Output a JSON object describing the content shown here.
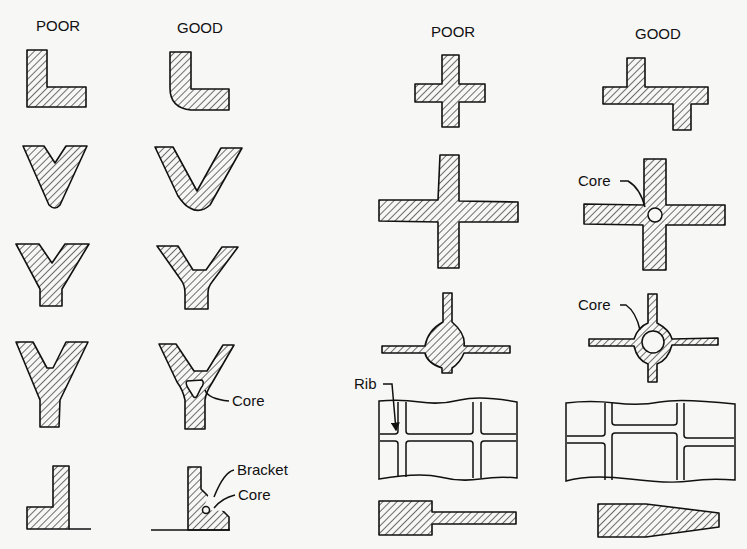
{
  "figure": {
    "left_panel": {
      "headers": {
        "poor": "POOR",
        "good": "GOOD"
      },
      "rows": [
        {
          "name": "L-section",
          "poor": "sharp inside corner",
          "good": "rounded corner"
        },
        {
          "name": "V-section",
          "poor": "sharp V",
          "good": "rounded V"
        },
        {
          "name": "Y-section",
          "poor": "sharp Y",
          "good": "filleted Y"
        },
        {
          "name": "Y-section-heavy",
          "poor": "heavy junction",
          "good": "cored junction",
          "good_label": "Core"
        },
        {
          "name": "T-bracket",
          "poor": "plain L",
          "good": "bracket with core",
          "good_labels": [
            "Bracket",
            "Core"
          ]
        }
      ]
    },
    "right_panel": {
      "headers": {
        "poor": "POOR",
        "good": "GOOD"
      },
      "rows": [
        {
          "name": "cross-small",
          "poor": "plus junction",
          "good": "staggered junction"
        },
        {
          "name": "cross-large",
          "poor": "plus junction",
          "good": "cored junction",
          "good_label": "Core"
        },
        {
          "name": "cross-hub",
          "poor": "solid hub",
          "good": "cored hub",
          "good_label": "Core"
        },
        {
          "name": "ribs",
          "poor": "crossing ribs",
          "good": "staggered ribs",
          "poor_label": "Rib"
        },
        {
          "name": "section-transition",
          "poor": "abrupt step",
          "good": "tapered"
        }
      ]
    },
    "labels": {
      "core_1": "Core",
      "core_2": "Core",
      "core_3": "Core",
      "core_4": "Core",
      "bracket": "Bracket",
      "rib": "Rib"
    }
  }
}
